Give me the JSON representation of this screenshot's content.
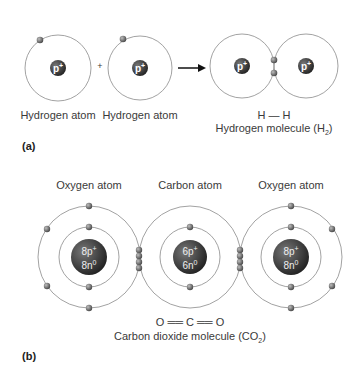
{
  "panel_a": {
    "label": "(a)",
    "atom1_label": "Hydrogen atom",
    "atom2_label": "Hydrogen atom",
    "plus": "+",
    "proton_symbol": "p",
    "proton_charge": "+",
    "formula": "H — H",
    "molecule_label": "Hydrogen molecule (H",
    "molecule_sub": "2",
    "molecule_close": ")"
  },
  "panel_b": {
    "label": "(b)",
    "left_label": "Oxygen atom",
    "center_label": "Carbon atom",
    "right_label": "Oxygen atom",
    "oxygen_protons": "8p",
    "oxygen_neutrons": "8n",
    "carbon_protons": "6p",
    "carbon_neutrons": "6n",
    "proton_charge": "+",
    "neutron_charge": "0",
    "formula": "O ══ C ══ O",
    "molecule_label": "Carbon dioxide molecule (CO",
    "molecule_sub": "2",
    "molecule_close": ")"
  },
  "colors": {
    "orbit": "#8a8a8a",
    "electron": "#6e6e6e",
    "nucleus": "#3a3a3a",
    "arrow": "#111111"
  }
}
